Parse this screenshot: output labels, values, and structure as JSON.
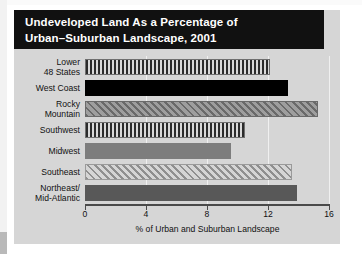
{
  "chart_data": {
    "type": "bar",
    "orientation": "horizontal",
    "title_line1": "Undeveloped Land As a Percentage of",
    "title_line2": "Urban–Suburban Landscape, 2001",
    "xlabel": "% of Urban and Suburban Landscape",
    "ylabel": "",
    "xlim": [
      0,
      16
    ],
    "xticks": [
      0,
      4,
      8,
      12,
      16
    ],
    "xtick_labels": [
      "0",
      "4",
      "8",
      "12",
      "16"
    ],
    "grid": true,
    "legend": "none",
    "categories": [
      "Lower\n48 States",
      "West Coast",
      "Rocky\nMountain",
      "Southwest",
      "Midwest",
      "Southeast",
      "Northeast/\nMid-Atlantic"
    ],
    "values": [
      12.1,
      13.3,
      15.3,
      10.5,
      9.6,
      13.6,
      13.9
    ],
    "patterns": [
      "vertical-stripe",
      "solid-black",
      "diagonal-hatch-dark",
      "vertical-stripe",
      "solid-gray",
      "diagonal-hatch-light",
      "solid-dark-gray"
    ]
  },
  "colors": {
    "panel_background": "#d6d6d6",
    "title_background": "#111111",
    "title_text": "#ffffff",
    "axis": "#4a4a4a",
    "gridline": "#f0f0f0",
    "bar_black": "#000000",
    "bar_gray": "#7d7d7d",
    "bar_dark_gray": "#585858"
  }
}
